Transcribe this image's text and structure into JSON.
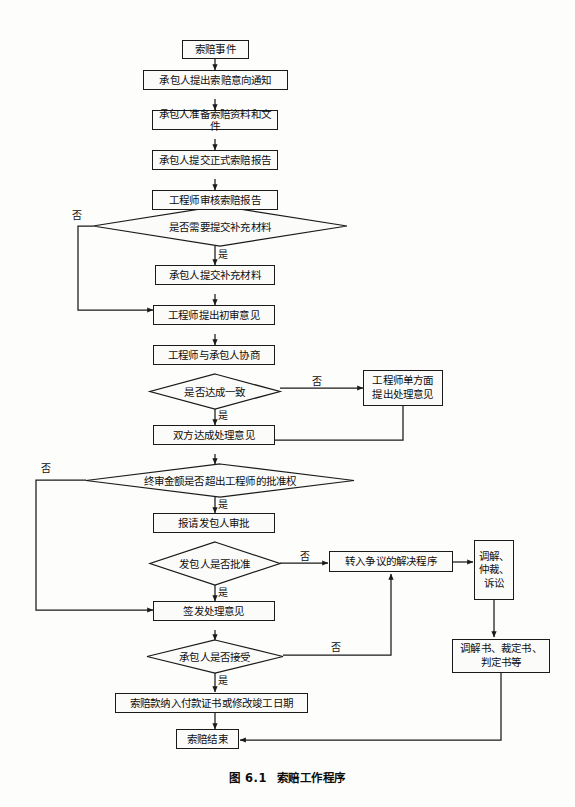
{
  "figure": {
    "caption_number": "图 6.1",
    "caption_title": "索赔工作程序",
    "language": "zh-CN",
    "type": "flowchart",
    "colors": {
      "stroke": "#1a1a1a",
      "fill": "#fbfbfa",
      "text": "#0d0d0d",
      "background": "#fdfdfc"
    }
  },
  "nodes": {
    "n01": {
      "label": "索赔事件",
      "shape": "process"
    },
    "n02": {
      "label": "承包人提出索赔意向通知",
      "shape": "process"
    },
    "n03": {
      "label": "承包人准备索赔资料和文件",
      "shape": "process"
    },
    "n04": {
      "label": "承包人提交正式索赔报告",
      "shape": "process"
    },
    "n05": {
      "label": "工程师审核索赔报告",
      "shape": "process"
    },
    "d01": {
      "label": "是否需要提交补充材料",
      "shape": "decision"
    },
    "n06": {
      "label": "承包人提交补充材料",
      "shape": "process"
    },
    "n07": {
      "label": "工程师提出初审意见",
      "shape": "process"
    },
    "n08": {
      "label": "工程师与承包人协商",
      "shape": "process"
    },
    "d02": {
      "label": "是否达成一致",
      "shape": "decision"
    },
    "n09": {
      "label_line1": "工程师单方面",
      "label_line2": "提出处理意见",
      "shape": "process"
    },
    "n10": {
      "label": "双方达成处理意见",
      "shape": "process"
    },
    "d03": {
      "label": "终审金额是否超出工程师的批准权",
      "shape": "decision"
    },
    "n11": {
      "label": "报请发包人审批",
      "shape": "process"
    },
    "d04": {
      "label": "发包人是否批准",
      "shape": "decision"
    },
    "n12": {
      "label": "转入争议的解决程序",
      "shape": "process"
    },
    "n13": {
      "label_line1": "调解、",
      "label_line2": "仲裁、",
      "label_line3": "诉讼",
      "shape": "process"
    },
    "n14": {
      "label": "签发处理意见",
      "shape": "process"
    },
    "n15": {
      "label_line1": "调解书、裁定书、",
      "label_line2": "判定书等",
      "shape": "process"
    },
    "d05": {
      "label": "承包人是否接受",
      "shape": "decision"
    },
    "n16": {
      "label": "索赔款纳入付款证书或修改竣工日期",
      "shape": "process"
    },
    "n17": {
      "label": "索赔结束",
      "shape": "process"
    }
  },
  "edge_labels": {
    "d01_no": "否",
    "d01_yes": "是",
    "d02_no": "否",
    "d02_yes": "是",
    "d03_no": "否",
    "d03_yes": "是",
    "d04_no": "否",
    "d04_yes": "是",
    "d05_no": "否",
    "d05_yes": "是"
  },
  "edges": [
    {
      "from": "n01",
      "to": "n02",
      "label": ""
    },
    {
      "from": "n02",
      "to": "n03",
      "label": ""
    },
    {
      "from": "n03",
      "to": "n04",
      "label": ""
    },
    {
      "from": "n04",
      "to": "n05",
      "label": ""
    },
    {
      "from": "n05",
      "to": "d01",
      "label": ""
    },
    {
      "from": "d01",
      "to": "n06",
      "label": "是"
    },
    {
      "from": "d01",
      "to": "n07",
      "label": "否"
    },
    {
      "from": "n06",
      "to": "n07",
      "label": ""
    },
    {
      "from": "n07",
      "to": "n08",
      "label": ""
    },
    {
      "from": "n08",
      "to": "d02",
      "label": ""
    },
    {
      "from": "d02",
      "to": "n10",
      "label": "是"
    },
    {
      "from": "d02",
      "to": "n09",
      "label": "否"
    },
    {
      "from": "n09",
      "to": "d03",
      "label": ""
    },
    {
      "from": "n10",
      "to": "d03",
      "label": ""
    },
    {
      "from": "d03",
      "to": "n11",
      "label": "是"
    },
    {
      "from": "d03",
      "to": "n14",
      "label": "否"
    },
    {
      "from": "n11",
      "to": "d04",
      "label": ""
    },
    {
      "from": "d04",
      "to": "n14",
      "label": "是"
    },
    {
      "from": "d04",
      "to": "n12",
      "label": "否"
    },
    {
      "from": "n12",
      "to": "n13",
      "label": ""
    },
    {
      "from": "n13",
      "to": "n15",
      "label": ""
    },
    {
      "from": "n15",
      "to": "n17",
      "label": ""
    },
    {
      "from": "n14",
      "to": "d05",
      "label": ""
    },
    {
      "from": "d05",
      "to": "n16",
      "label": "是"
    },
    {
      "from": "d05",
      "to": "n12",
      "label": "否"
    },
    {
      "from": "n16",
      "to": "n17",
      "label": ""
    }
  ]
}
